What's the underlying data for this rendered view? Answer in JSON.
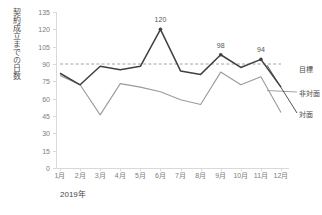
{
  "chart_data": {
    "type": "line",
    "title": "",
    "ylabel": "契約成立までの日数",
    "xlabel": "2019年",
    "categories": [
      "1月",
      "2月",
      "3月",
      "4月",
      "5月",
      "6月",
      "7月",
      "8月",
      "9月",
      "10月",
      "11月",
      "12月"
    ],
    "ylim": [
      0,
      135
    ],
    "yticks": [
      0,
      15,
      30,
      45,
      60,
      75,
      90,
      105,
      120,
      135
    ],
    "ytick_labels": [
      "0",
      "15",
      "30",
      "45",
      "60",
      "75",
      "90",
      "105",
      "120",
      "135"
    ],
    "grid": false,
    "legend_position": "right",
    "series": [
      {
        "name": "非対面",
        "style": "solid",
        "color": "#404040",
        "values": [
          82,
          72,
          88,
          85,
          88,
          120,
          84,
          81,
          98,
          87,
          94,
          70
        ],
        "point_labels": [
          {
            "category": "6月",
            "value": 120,
            "text": "120"
          },
          {
            "category": "9月",
            "value": 98,
            "text": "98"
          },
          {
            "category": "11月",
            "value": 94,
            "text": "94"
          }
        ]
      },
      {
        "name": "対面",
        "style": "solid",
        "color": "#9a9a9a",
        "values": [
          80,
          72,
          46,
          73,
          70,
          66,
          59,
          55,
          83,
          72,
          79,
          48
        ],
        "point_labels": []
      },
      {
        "name": "目標",
        "style": "dashed",
        "color": "#9a9a9a",
        "constant": 90,
        "values": [
          90,
          90,
          90,
          90,
          90,
          90,
          90,
          90,
          90,
          90,
          90,
          90
        ],
        "point_labels": []
      }
    ],
    "legend_entries": [
      {
        "label": "目標",
        "color": "#9a9a9a",
        "style": "dashed"
      },
      {
        "label": "非対面",
        "color": "#404040",
        "style": "solid"
      },
      {
        "label": "対面",
        "color": "#9a9a9a",
        "style": "solid"
      }
    ]
  }
}
